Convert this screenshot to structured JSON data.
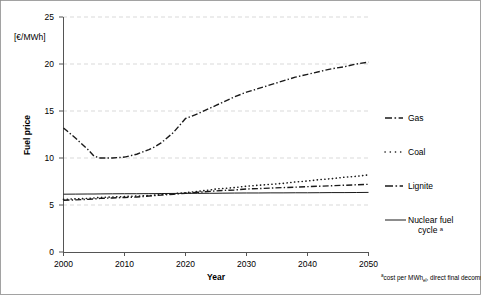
{
  "chart_data": {
    "type": "line",
    "title": "",
    "xlabel": "Year",
    "ylabel": "Fuel price",
    "unit_label": "[€/MWh]",
    "xlim": [
      2000,
      2050
    ],
    "ylim": [
      0,
      25
    ],
    "xticks": [
      "2000",
      "2010",
      "2020",
      "2030",
      "2040",
      "2050"
    ],
    "yticks": [
      "0",
      "5",
      "10",
      "15",
      "20",
      "25"
    ],
    "grid": "horizontal dashed gridlines at every y tick",
    "legend_position": "right outside",
    "x": [
      2000,
      2002,
      2004,
      2005,
      2006,
      2008,
      2010,
      2012,
      2014,
      2015,
      2016,
      2018,
      2020,
      2022,
      2024,
      2025,
      2026,
      2028,
      2030,
      2032,
      2034,
      2036,
      2038,
      2040,
      2042,
      2044,
      2046,
      2048,
      2050
    ],
    "series": [
      {
        "name": "Gas",
        "style": "dash-dot",
        "values": [
          13.2,
          12.1,
          10.9,
          10.2,
          10.0,
          10.0,
          10.1,
          10.4,
          10.9,
          11.2,
          11.6,
          12.7,
          14.2,
          14.7,
          15.3,
          15.6,
          15.9,
          16.5,
          17.0,
          17.4,
          17.8,
          18.2,
          18.6,
          18.9,
          19.2,
          19.5,
          19.7,
          20.0,
          20.2
        ]
      },
      {
        "name": "Coal",
        "style": "dotted",
        "values": [
          5.6,
          5.65,
          5.7,
          5.75,
          5.8,
          5.85,
          5.9,
          5.95,
          6.0,
          6.05,
          6.1,
          6.2,
          6.3,
          6.45,
          6.6,
          6.7,
          6.75,
          6.85,
          7.0,
          7.1,
          7.2,
          7.3,
          7.45,
          7.55,
          7.7,
          7.8,
          7.95,
          8.05,
          8.2
        ]
      },
      {
        "name": "Lignite",
        "style": "dash-dot",
        "values": [
          5.5,
          5.55,
          5.6,
          5.65,
          5.7,
          5.75,
          5.8,
          5.85,
          5.95,
          6.0,
          6.05,
          6.15,
          6.25,
          6.35,
          6.45,
          6.5,
          6.55,
          6.6,
          6.7,
          6.75,
          6.8,
          6.85,
          6.9,
          6.95,
          7.0,
          7.05,
          7.1,
          7.15,
          7.2
        ]
      },
      {
        "name": "Nuclear fuel cycle ᵃ",
        "style": "solid",
        "values": [
          6.15,
          6.16,
          6.17,
          6.17,
          6.18,
          6.19,
          6.2,
          6.2,
          6.21,
          6.21,
          6.22,
          6.23,
          6.24,
          6.24,
          6.25,
          6.25,
          6.26,
          6.27,
          6.28,
          6.28,
          6.29,
          6.29,
          6.3,
          6.3,
          6.31,
          6.32,
          6.32,
          6.33,
          6.34
        ]
      }
    ],
    "annotations": {
      "footnote_marker": "a",
      "footnote_prefix": "cost per MWh",
      "footnote_sub": "el",
      "footnote_rest": ", direct final decommitm"
    }
  },
  "legend": {
    "items": [
      {
        "label": "Gas",
        "style": "dash-dot"
      },
      {
        "label": "Coal",
        "style": "dotted"
      },
      {
        "label": "Lignite",
        "style": "dash-dot"
      },
      {
        "label": "Nuclear fuel",
        "label2": "cycle ᵃ",
        "style": "solid"
      }
    ]
  },
  "axes": {
    "y_unit": "[€/MWh]",
    "y_title": "Fuel price",
    "x_title": "Year",
    "yticks": [
      "25",
      "20",
      "15",
      "10",
      "5",
      "0"
    ],
    "xticks": [
      "2000",
      "2010",
      "2020",
      "2030",
      "2040",
      "2050"
    ]
  },
  "colors": {
    "line": "#1a1a1a",
    "grid": "#c9c9c9",
    "axis": "#555555",
    "frame": "#8c8c8c",
    "background": "#ffffff"
  }
}
